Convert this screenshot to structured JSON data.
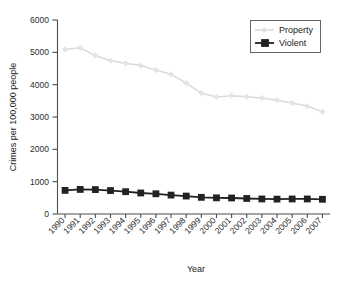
{
  "chart_data": {
    "type": "line",
    "title": "",
    "xlabel": "Year",
    "ylabel": "Crimes per 100,000 people",
    "categories": [
      "1990",
      "1991",
      "1992",
      "1993",
      "1994",
      "1995",
      "1996",
      "1997",
      "1998",
      "1999",
      "2000",
      "2001",
      "2002",
      "2003",
      "2004",
      "2005",
      "2006",
      "2007"
    ],
    "x": [
      1990,
      1991,
      1992,
      1993,
      1994,
      1995,
      1996,
      1997,
      1998,
      1999,
      2000,
      2001,
      2002,
      2003,
      2004,
      2005,
      2006,
      2007
    ],
    "series": [
      {
        "name": "Property",
        "color": "#d9d9d9",
        "marker": "diamond",
        "values": [
          5090,
          5140,
          4900,
          4740,
          4660,
          4590,
          4450,
          4320,
          4050,
          3740,
          3620,
          3660,
          3630,
          3590,
          3520,
          3430,
          3340,
          3160
        ]
      },
      {
        "name": "Violent",
        "color": "#222222",
        "marker": "square",
        "values": [
          730,
          760,
          755,
          725,
          690,
          650,
          625,
          585,
          555,
          515,
          500,
          495,
          480,
          465,
          460,
          465,
          465,
          455
        ]
      }
    ],
    "ylim": [
      0,
      6000
    ],
    "yticks": [
      0,
      1000,
      2000,
      3000,
      4000,
      5000,
      6000
    ],
    "ytick_labels": [
      "0",
      "1000",
      "2000",
      "3000",
      "4000",
      "5000",
      "6000"
    ],
    "grid": false,
    "legend_position": "top-right",
    "legend_entries": [
      "Property",
      "Violent"
    ],
    "xtick_rotation": 45
  }
}
